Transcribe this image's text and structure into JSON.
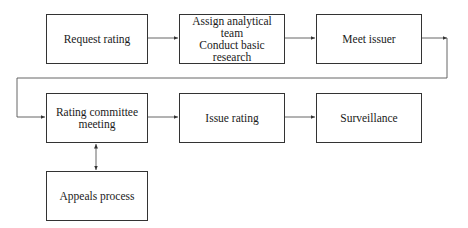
{
  "diagram": {
    "type": "flowchart",
    "nodes": [
      {
        "id": "request",
        "lines": [
          "Request rating"
        ]
      },
      {
        "id": "assign",
        "lines": [
          "Assign analytical team",
          "Conduct basic research"
        ]
      },
      {
        "id": "meet",
        "lines": [
          "Meet issuer"
        ]
      },
      {
        "id": "committee",
        "lines": [
          "Rating committee",
          "meeting"
        ]
      },
      {
        "id": "issue",
        "lines": [
          "Issue rating"
        ]
      },
      {
        "id": "surveillance",
        "lines": [
          "Surveillance"
        ]
      },
      {
        "id": "appeals",
        "lines": [
          "Appeals process"
        ]
      }
    ],
    "edges": [
      {
        "from": "request",
        "to": "assign",
        "direction": "forward"
      },
      {
        "from": "assign",
        "to": "meet",
        "direction": "forward"
      },
      {
        "from": "meet",
        "to": "committee",
        "direction": "forward"
      },
      {
        "from": "committee",
        "to": "issue",
        "direction": "forward"
      },
      {
        "from": "issue",
        "to": "surveillance",
        "direction": "forward"
      },
      {
        "from": "committee",
        "to": "appeals",
        "direction": "both"
      }
    ],
    "colors": {
      "line": "#333333",
      "background": "#ffffff",
      "text": "#1a1a1a"
    }
  }
}
